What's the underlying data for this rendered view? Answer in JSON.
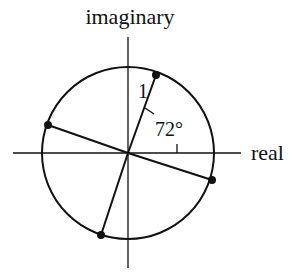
{
  "diagram": {
    "axes": {
      "vertical_label": "imaginary",
      "horizontal_label": "real"
    },
    "circle": {
      "radius_label": "1"
    },
    "angle_label": "72°",
    "points": [
      {
        "name": "root-1",
        "angle_deg": -18
      },
      {
        "name": "root-2",
        "angle_deg": 54
      },
      {
        "name": "root-3",
        "angle_deg": 126
      },
      {
        "name": "root-4",
        "angle_deg": 198
      },
      {
        "name": "root-5",
        "angle_deg": 270
      }
    ],
    "colors": {
      "ink": "#111111",
      "background": "#ffffff"
    }
  }
}
